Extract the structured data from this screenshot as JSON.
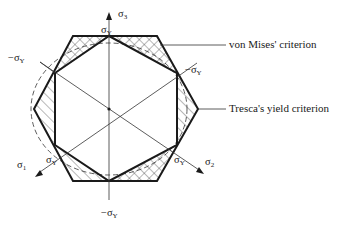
{
  "diagram": {
    "axes": {
      "sigma3": {
        "symbol": "σ",
        "sub": "3"
      },
      "sigma1": {
        "symbol": "σ",
        "sub": "1"
      },
      "sigma2": {
        "symbol": "σ",
        "sub": "2"
      }
    },
    "vertex_labels": {
      "top": {
        "symbol": "σ",
        "sub": "Y"
      },
      "upper_left": {
        "symbol": "−σ",
        "sub": "Y"
      },
      "upper_right": {
        "symbol": "−σ",
        "sub": "Y"
      },
      "lower_left": {
        "symbol": "σ",
        "sub": "Y"
      },
      "lower_right": {
        "symbol": "σ",
        "sub": "Y"
      },
      "bottom": {
        "symbol": "−σ",
        "sub": "Y"
      }
    },
    "callouts": {
      "von_mises": "von Mises' criterion",
      "tresca": "Tresca's yield criterion"
    },
    "colors": {
      "line": "#1a1a1a",
      "background": "#ffffff"
    }
  }
}
